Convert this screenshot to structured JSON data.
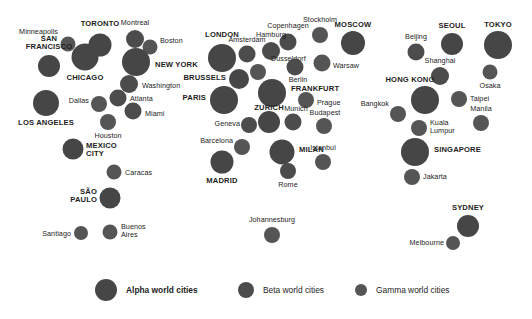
{
  "colors": {
    "alpha": "#464646",
    "beta": "#4c4c4c",
    "gamma": "#555555",
    "text": "#1d1d1d",
    "background": "#ffffff"
  },
  "legend": {
    "items": [
      {
        "label": "Alpha world cities",
        "tier": "alpha",
        "radius": 11,
        "x": 95,
        "y": 22
      },
      {
        "label": "Beta world cities",
        "tier": "beta",
        "radius": 8,
        "x": 238,
        "y": 22
      },
      {
        "label": "Gamma world cities",
        "tier": "gamma",
        "radius": 6,
        "x": 355,
        "y": 22
      }
    ]
  },
  "chart_data": {
    "type": "scatter",
    "xlabel": "",
    "ylabel": "",
    "legend_position": "bottom",
    "grid": false,
    "size_encoding": "alpha = largest, beta = medium, gamma = smallest",
    "cities": [
      {
        "name": "Minneapolis",
        "tier": "gamma",
        "x": 68,
        "y": 44,
        "r": 7.5,
        "lx": 58,
        "ly": 32,
        "anchor": "right"
      },
      {
        "name": "TORONTO",
        "tier": "alpha",
        "x": 100,
        "y": 45,
        "r": 11.5,
        "lx": 100,
        "ly": 24,
        "anchor": "center"
      },
      {
        "name": "Montreal",
        "tier": "beta",
        "x": 135,
        "y": 39,
        "r": 9,
        "lx": 135,
        "ly": 23,
        "anchor": "center"
      },
      {
        "name": "Boston",
        "tier": "gamma",
        "x": 150,
        "y": 47,
        "r": 7.5,
        "lx": 160,
        "ly": 41,
        "anchor": "left"
      },
      {
        "name": "SAN FRANCISCO",
        "tier": "alpha",
        "x": 49,
        "y": 66,
        "r": 11,
        "lx": 49,
        "ly": 43,
        "anchor": "center"
      },
      {
        "name": "CHICAGO",
        "tier": "alpha",
        "x": 85,
        "y": 57,
        "r": 13.5,
        "lx": 85,
        "ly": 78,
        "anchor": "center"
      },
      {
        "name": "NEW YORK",
        "tier": "alpha",
        "x": 136,
        "y": 62,
        "r": 14,
        "lx": 155,
        "ly": 65,
        "anchor": "left"
      },
      {
        "name": "Washington",
        "tier": "beta",
        "x": 129,
        "y": 84,
        "r": 9,
        "lx": 142,
        "ly": 86,
        "anchor": "left"
      },
      {
        "name": "Atlanta",
        "tier": "beta",
        "x": 118,
        "y": 98,
        "r": 8.5,
        "lx": 130,
        "ly": 99,
        "anchor": "left"
      },
      {
        "name": "LOS ANGELES",
        "tier": "alpha",
        "x": 46,
        "y": 103,
        "r": 13,
        "lx": 46,
        "ly": 123,
        "anchor": "center"
      },
      {
        "name": "Dallas",
        "tier": "gamma",
        "x": 99,
        "y": 104,
        "r": 8,
        "lx": 89,
        "ly": 101,
        "anchor": "right"
      },
      {
        "name": "Miami",
        "tier": "beta",
        "x": 133,
        "y": 111,
        "r": 8.5,
        "lx": 145,
        "ly": 114,
        "anchor": "left"
      },
      {
        "name": "Houston",
        "tier": "gamma",
        "x": 108,
        "y": 122,
        "r": 8,
        "lx": 108,
        "ly": 136,
        "anchor": "center"
      },
      {
        "name": "MEXICO CITY",
        "tier": "alpha",
        "x": 73,
        "y": 149,
        "r": 10.5,
        "lx": 86,
        "ly": 150,
        "anchor": "left"
      },
      {
        "name": "Caracas",
        "tier": "gamma",
        "x": 114,
        "y": 172,
        "r": 7.5,
        "lx": 125,
        "ly": 173,
        "anchor": "left"
      },
      {
        "name": "SÃO PAULO",
        "tier": "alpha",
        "x": 110,
        "y": 198,
        "r": 10.5,
        "lx": 97,
        "ly": 196,
        "anchor": "right"
      },
      {
        "name": "Santiago",
        "tier": "gamma",
        "x": 81,
        "y": 233,
        "r": 7,
        "lx": 71,
        "ly": 234,
        "anchor": "right"
      },
      {
        "name": "Buenos Aires",
        "tier": "gamma",
        "x": 110,
        "y": 232,
        "r": 7.5,
        "lx": 121,
        "ly": 231,
        "anchor": "left"
      },
      {
        "name": "LONDON",
        "tier": "alpha",
        "x": 222,
        "y": 58,
        "r": 14,
        "lx": 222,
        "ly": 35,
        "anchor": "center"
      },
      {
        "name": "Amsterdam",
        "tier": "beta",
        "x": 247,
        "y": 54,
        "r": 8.5,
        "lx": 247,
        "ly": 40,
        "anchor": "center"
      },
      {
        "name": "Copenhagen",
        "tier": "beta",
        "x": 288,
        "y": 42,
        "r": 8.5,
        "lx": 288,
        "ly": 26,
        "anchor": "center"
      },
      {
        "name": "Stockholm",
        "tier": "gamma",
        "x": 320,
        "y": 35,
        "r": 8,
        "lx": 320,
        "ly": 20,
        "anchor": "center"
      },
      {
        "name": "MOSCOW",
        "tier": "alpha",
        "x": 353,
        "y": 43,
        "r": 12,
        "lx": 353,
        "ly": 25,
        "anchor": "center"
      },
      {
        "name": "Hamburg",
        "tier": "beta",
        "x": 271,
        "y": 51,
        "r": 9,
        "lx": 271,
        "ly": 35,
        "anchor": "center"
      },
      {
        "name": "Dusseldorf",
        "tier": "gamma",
        "x": 258,
        "y": 72,
        "r": 8,
        "lx": 271,
        "ly": 59,
        "anchor": "left"
      },
      {
        "name": "Warsaw",
        "tier": "gamma",
        "x": 322,
        "y": 63,
        "r": 8.5,
        "lx": 333,
        "ly": 66,
        "anchor": "left"
      },
      {
        "name": "Berlin",
        "tier": "beta",
        "x": 295,
        "y": 67,
        "r": 8.5,
        "lx": 298,
        "ly": 80,
        "anchor": "center"
      },
      {
        "name": "BRUSSELS",
        "tier": "alpha",
        "x": 239,
        "y": 79,
        "r": 10,
        "lx": 226,
        "ly": 78,
        "anchor": "right"
      },
      {
        "name": "PARIS",
        "tier": "alpha",
        "x": 224,
        "y": 100,
        "r": 14,
        "lx": 206,
        "ly": 98,
        "anchor": "right"
      },
      {
        "name": "FRANKFURT",
        "tier": "alpha",
        "x": 272,
        "y": 93,
        "r": 14,
        "lx": 291,
        "ly": 89,
        "anchor": "left"
      },
      {
        "name": "Prague",
        "tier": "gamma",
        "x": 306,
        "y": 100,
        "r": 8,
        "lx": 317,
        "ly": 103,
        "anchor": "left"
      },
      {
        "name": "ZURICH",
        "tier": "alpha",
        "x": 269,
        "y": 122,
        "r": 11,
        "lx": 269,
        "ly": 108,
        "anchor": "center"
      },
      {
        "name": "Munich",
        "tier": "beta",
        "x": 293,
        "y": 122,
        "r": 8.5,
        "lx": 296,
        "ly": 109,
        "anchor": "center"
      },
      {
        "name": "Budapest",
        "tier": "gamma",
        "x": 324,
        "y": 126,
        "r": 8,
        "lx": 325,
        "ly": 113,
        "anchor": "center"
      },
      {
        "name": "Geneva",
        "tier": "beta",
        "x": 249,
        "y": 125,
        "r": 8,
        "lx": 240,
        "ly": 124,
        "anchor": "right"
      },
      {
        "name": "Barcelona",
        "tier": "gamma",
        "x": 242,
        "y": 147,
        "r": 8,
        "lx": 233,
        "ly": 141,
        "anchor": "right"
      },
      {
        "name": "MILAN",
        "tier": "alpha",
        "x": 282,
        "y": 152,
        "r": 12.5,
        "lx": 299,
        "ly": 150,
        "anchor": "left"
      },
      {
        "name": "MADRID",
        "tier": "alpha",
        "x": 222,
        "y": 162,
        "r": 11.5,
        "lx": 222,
        "ly": 181,
        "anchor": "center"
      },
      {
        "name": "Rome",
        "tier": "beta",
        "x": 288,
        "y": 171,
        "r": 8,
        "lx": 288,
        "ly": 185,
        "anchor": "center"
      },
      {
        "name": "Istanbul",
        "tier": "gamma",
        "x": 323,
        "y": 162,
        "r": 8,
        "lx": 323,
        "ly": 148,
        "anchor": "center"
      },
      {
        "name": "Johannesburg",
        "tier": "gamma",
        "x": 272,
        "y": 235,
        "r": 8,
        "lx": 272,
        "ly": 220,
        "anchor": "center"
      },
      {
        "name": "SEOUL",
        "tier": "alpha",
        "x": 452,
        "y": 44,
        "r": 11,
        "lx": 452,
        "ly": 26,
        "anchor": "center"
      },
      {
        "name": "TOKYO",
        "tier": "alpha",
        "x": 498,
        "y": 45,
        "r": 14,
        "lx": 498,
        "ly": 25,
        "anchor": "center"
      },
      {
        "name": "Beijing",
        "tier": "beta",
        "x": 416,
        "y": 52,
        "r": 8.5,
        "lx": 416,
        "ly": 37,
        "anchor": "center"
      },
      {
        "name": "Shanghai",
        "tier": "beta",
        "x": 440,
        "y": 76,
        "r": 9,
        "lx": 440,
        "ly": 61,
        "anchor": "center"
      },
      {
        "name": "Osaka",
        "tier": "gamma",
        "x": 490,
        "y": 72,
        "r": 7.5,
        "lx": 490,
        "ly": 86,
        "anchor": "center"
      },
      {
        "name": "HONG KONG",
        "tier": "alpha",
        "x": 425,
        "y": 100,
        "r": 14,
        "lx": 410,
        "ly": 80,
        "anchor": "center"
      },
      {
        "name": "Taipei",
        "tier": "gamma",
        "x": 459,
        "y": 99,
        "r": 8,
        "lx": 470,
        "ly": 99,
        "anchor": "left"
      },
      {
        "name": "Bangkok",
        "tier": "gamma",
        "x": 398,
        "y": 114,
        "r": 8,
        "lx": 389,
        "ly": 104,
        "anchor": "right"
      },
      {
        "name": "Manila",
        "tier": "gamma",
        "x": 481,
        "y": 123,
        "r": 8,
        "lx": 481,
        "ly": 109,
        "anchor": "center"
      },
      {
        "name": "Kuala Lumpur",
        "tier": "gamma",
        "x": 419,
        "y": 128,
        "r": 8,
        "lx": 430,
        "ly": 127,
        "anchor": "left"
      },
      {
        "name": "SINGAPORE",
        "tier": "alpha",
        "x": 415,
        "y": 152,
        "r": 14,
        "lx": 434,
        "ly": 150,
        "anchor": "left"
      },
      {
        "name": "Jakarta",
        "tier": "gamma",
        "x": 412,
        "y": 177,
        "r": 8,
        "lx": 423,
        "ly": 177,
        "anchor": "left"
      },
      {
        "name": "SYDNEY",
        "tier": "alpha",
        "x": 468,
        "y": 226,
        "r": 11,
        "lx": 468,
        "ly": 208,
        "anchor": "center"
      },
      {
        "name": "Melbourne",
        "tier": "gamma",
        "x": 453,
        "y": 243,
        "r": 7,
        "lx": 444,
        "ly": 243,
        "anchor": "right"
      }
    ]
  }
}
